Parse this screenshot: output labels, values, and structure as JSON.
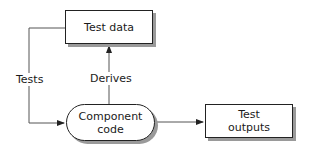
{
  "diagram": {
    "nodes": [
      {
        "id": "test_data",
        "label": "Test data",
        "shape": "rectangle"
      },
      {
        "id": "component_code",
        "label": "Component\ncode",
        "line1": "Component",
        "line2": "code",
        "shape": "rounded"
      },
      {
        "id": "test_outputs",
        "label": "Test\noutputs",
        "line1": "Test",
        "line2": "outputs",
        "shape": "rectangle"
      }
    ],
    "edges": [
      {
        "from": "test_data",
        "to": "component_code",
        "label": "Tests"
      },
      {
        "from": "component_code",
        "to": "test_data",
        "label": "Derives"
      },
      {
        "from": "component_code",
        "to": "test_outputs",
        "label": ""
      }
    ],
    "labels": {
      "tests": "Tests",
      "derives": "Derives"
    },
    "colors": {
      "stroke": "#222222",
      "shadow": "#9a9a9a",
      "fill": "#ffffff"
    }
  }
}
